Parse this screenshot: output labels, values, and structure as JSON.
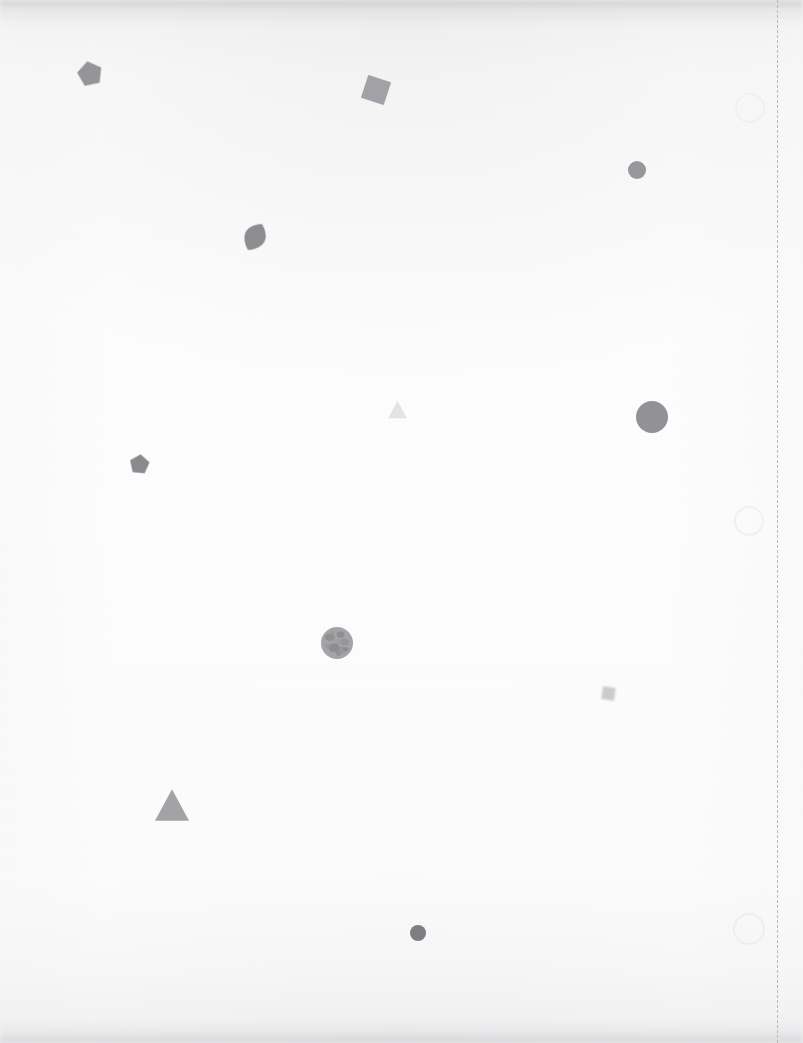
{
  "page": {
    "width": 803,
    "height": 1043,
    "background_color": "#fbfbfb",
    "paper_tint": "#fdfdfd",
    "edge_shadow_color": "#8c8c92",
    "caption": ""
  },
  "margin_rule": {
    "name": "dashed-margin-rule",
    "x": 777,
    "y_start": 0,
    "y_end": 1043,
    "color": "#b9b9bd",
    "thickness": 1,
    "dash_length": 6,
    "gap_length": 11
  },
  "punch_rings": [
    {
      "id": "ring-1",
      "cx": 748,
      "cy": 106,
      "r": 13,
      "stroke": "#f0f0f2",
      "stroke_width": 2
    },
    {
      "id": "ring-2",
      "cx": 747,
      "cy": 519,
      "r": 13,
      "stroke": "#f0f0f2",
      "stroke_width": 2
    },
    {
      "id": "ring-3",
      "cx": 747,
      "cy": 927,
      "r": 14,
      "stroke": "#eeeef0",
      "stroke_width": 2
    }
  ],
  "shapes": [
    {
      "id": "shape-1",
      "name": "pentagon",
      "kind": "pentagon",
      "cx": 90,
      "cy": 74,
      "size": 24,
      "rotation": -12,
      "fill": "#8d8d91",
      "opacity": 0.92,
      "blur": "soft"
    },
    {
      "id": "shape-2",
      "name": "square",
      "kind": "square",
      "cx": 376,
      "cy": 90,
      "size": 24,
      "rotation": 18,
      "fill": "#9a9a9e",
      "opacity": 0.9,
      "blur": "soft"
    },
    {
      "id": "shape-3",
      "name": "circle-small",
      "kind": "circle",
      "cx": 637,
      "cy": 170,
      "size": 18,
      "rotation": 0,
      "fill": "#909094",
      "opacity": 0.92,
      "blur": "soft"
    },
    {
      "id": "shape-4",
      "name": "leaf",
      "kind": "leaf",
      "cx": 255,
      "cy": 237,
      "size": 28,
      "rotation": 28,
      "fill": "#85858a",
      "opacity": 0.93,
      "blur": "soft"
    },
    {
      "id": "shape-5",
      "name": "triangle-pale",
      "kind": "triangle",
      "cx": 397,
      "cy": 409,
      "size": 19,
      "rotation": 0,
      "fill": "#e3e3e5",
      "opacity": 0.95,
      "blur": "soft"
    },
    {
      "id": "shape-6",
      "name": "circle-large",
      "kind": "circle",
      "cx": 652,
      "cy": 417,
      "size": 32,
      "rotation": 0,
      "fill": "#8b8b90",
      "opacity": 0.94,
      "blur": "soft"
    },
    {
      "id": "shape-7",
      "name": "pentagon-small",
      "kind": "pentagon",
      "cx": 139,
      "cy": 464,
      "size": 19,
      "rotation": 6,
      "fill": "#818186",
      "opacity": 0.93,
      "blur": "soft"
    },
    {
      "id": "shape-8",
      "name": "circle-textured",
      "kind": "circle-textured",
      "cx": 337,
      "cy": 643,
      "size": 32,
      "rotation": 0,
      "fill": "#9b9b9f",
      "opacity": 0.9,
      "blur": "soft"
    },
    {
      "id": "shape-9",
      "name": "square-pale",
      "kind": "square",
      "cx": 608,
      "cy": 693,
      "size": 13,
      "rotation": 8,
      "fill": "#c6c6ca",
      "opacity": 0.9,
      "blur": "softer"
    },
    {
      "id": "shape-10",
      "name": "triangle-large",
      "kind": "triangle",
      "cx": 172,
      "cy": 805,
      "size": 34,
      "rotation": 0,
      "fill": "#9d9da1",
      "opacity": 0.93,
      "blur": "soft"
    },
    {
      "id": "shape-11",
      "name": "circle-dot",
      "kind": "circle",
      "cx": 418,
      "cy": 933,
      "size": 16,
      "rotation": 0,
      "fill": "#77777c",
      "opacity": 0.95,
      "blur": "soft"
    }
  ]
}
